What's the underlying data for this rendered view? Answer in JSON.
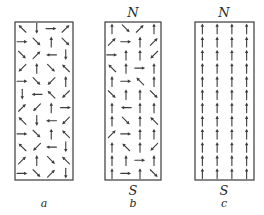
{
  "figure": {
    "colors": {
      "stroke": "#3a3a3a",
      "arrow": "#3c3c3c",
      "label": "#2a2a2a",
      "background": "#ffffff"
    },
    "panels": [
      {
        "id": "a",
        "caption": "a",
        "north_label": "",
        "south_label": "",
        "box": {
          "x": 15,
          "y": 22,
          "w": 58,
          "h": 158
        },
        "columns": 4,
        "rows": 12,
        "arrows": [
          [
            "NW",
            "S",
            "E",
            "NE"
          ],
          [
            "E",
            "SE",
            "N",
            "SE"
          ],
          [
            "SE",
            "NE",
            "W",
            "S"
          ],
          [
            "SW",
            "N",
            "SE",
            "NW"
          ],
          [
            "E",
            "SE",
            "SW",
            "N"
          ],
          [
            "S",
            "W",
            "NW",
            "SW"
          ],
          [
            "NE",
            "SW",
            "N",
            "E"
          ],
          [
            "NW",
            "S",
            "W",
            "SW"
          ],
          [
            "E",
            "SE",
            "N",
            "NW"
          ],
          [
            "NW",
            "SW",
            "W",
            "S"
          ],
          [
            "NE",
            "N",
            "SE",
            "NW"
          ],
          [
            "E",
            "SE",
            "NE",
            "S"
          ]
        ]
      },
      {
        "id": "b",
        "caption": "b",
        "north_label": "N",
        "south_label": "S",
        "box": {
          "x": 105,
          "y": 22,
          "w": 56,
          "h": 158
        },
        "columns": 4,
        "rows": 12,
        "arrows": [
          [
            "N",
            "SE",
            "NE",
            "N"
          ],
          [
            "NE",
            "E",
            "N",
            "NE"
          ],
          [
            "E",
            "N",
            "N",
            "SW"
          ],
          [
            "NW",
            "N",
            "E",
            "N"
          ],
          [
            "N",
            "E",
            "NW",
            "N"
          ],
          [
            "SE",
            "N",
            "N",
            "SE"
          ],
          [
            "N",
            "W",
            "N",
            "N"
          ],
          [
            "N",
            "SE",
            "N",
            "NW"
          ],
          [
            "NE",
            "E",
            "N",
            "N"
          ],
          [
            "N",
            "NW",
            "N",
            "SW"
          ],
          [
            "N",
            "N",
            "E",
            "N"
          ],
          [
            "N",
            "E",
            "N",
            "SE"
          ]
        ]
      },
      {
        "id": "c",
        "caption": "c",
        "north_label": "N",
        "south_label": "S",
        "box": {
          "x": 195,
          "y": 22,
          "w": 59,
          "h": 158
        },
        "columns": 4,
        "rows": 12,
        "arrows": [
          [
            "N",
            "N",
            "N",
            "N"
          ],
          [
            "N",
            "N",
            "N",
            "N"
          ],
          [
            "N",
            "N",
            "N",
            "N"
          ],
          [
            "N",
            "N",
            "N",
            "N"
          ],
          [
            "N",
            "N",
            "N",
            "N"
          ],
          [
            "N",
            "N",
            "N",
            "N"
          ],
          [
            "N",
            "N",
            "N",
            "N"
          ],
          [
            "N",
            "N",
            "N",
            "N"
          ],
          [
            "N",
            "N",
            "N",
            "N"
          ],
          [
            "N",
            "N",
            "N",
            "N"
          ],
          [
            "N",
            "N",
            "N",
            "N"
          ],
          [
            "N",
            "N",
            "N",
            "N"
          ]
        ]
      }
    ]
  }
}
